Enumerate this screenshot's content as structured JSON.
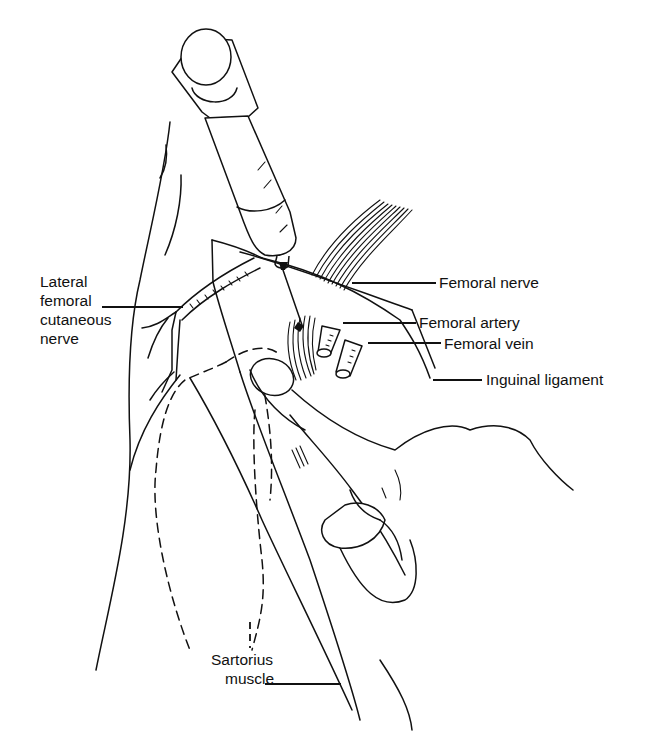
{
  "figure": {
    "style": "black line drawing on white",
    "colors": {
      "background": "#ffffff",
      "ink": "#111111"
    }
  },
  "labels": {
    "lateral_femoral_cutaneous_nerve": [
      "Lateral",
      "femoral",
      "cutaneous",
      "nerve"
    ],
    "femoral_nerve": "Femoral nerve",
    "femoral_artery": "Femoral artery",
    "femoral_vein": "Femoral vein",
    "inguinal_ligament": "Inguinal ligament",
    "sartorius_muscle": [
      "Sartorius",
      "muscle"
    ]
  }
}
